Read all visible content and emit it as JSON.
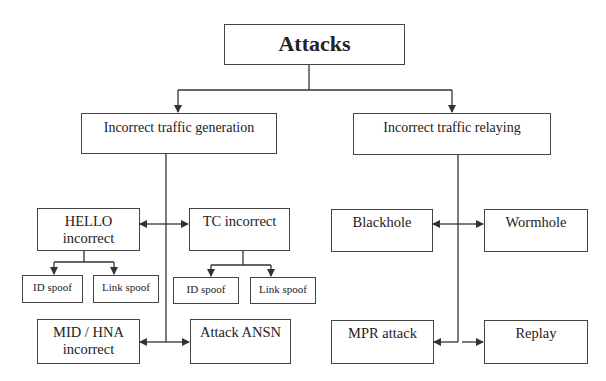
{
  "diagram": {
    "root": {
      "label": "Attacks"
    },
    "categories": [
      {
        "label": "Incorrect traffic generation",
        "children": [
          {
            "label": "HELLO incorrect",
            "children": [
              {
                "label": "ID spoof"
              },
              {
                "label": "Link spoof"
              }
            ]
          },
          {
            "label": "TC incorrect",
            "children": [
              {
                "label": "ID spoof"
              },
              {
                "label": "Link spoof"
              }
            ]
          },
          {
            "label": "MID / HNA incorrect"
          },
          {
            "label": "Attack ANSN"
          }
        ]
      },
      {
        "label": "Incorrect traffic relaying",
        "children": [
          {
            "label": "Blackhole"
          },
          {
            "label": "Wormhole"
          },
          {
            "label": "MPR attack"
          },
          {
            "label": "Replay"
          }
        ]
      }
    ]
  },
  "colors": {
    "line": "#333333",
    "border": "#444444",
    "background": "#ffffff"
  }
}
